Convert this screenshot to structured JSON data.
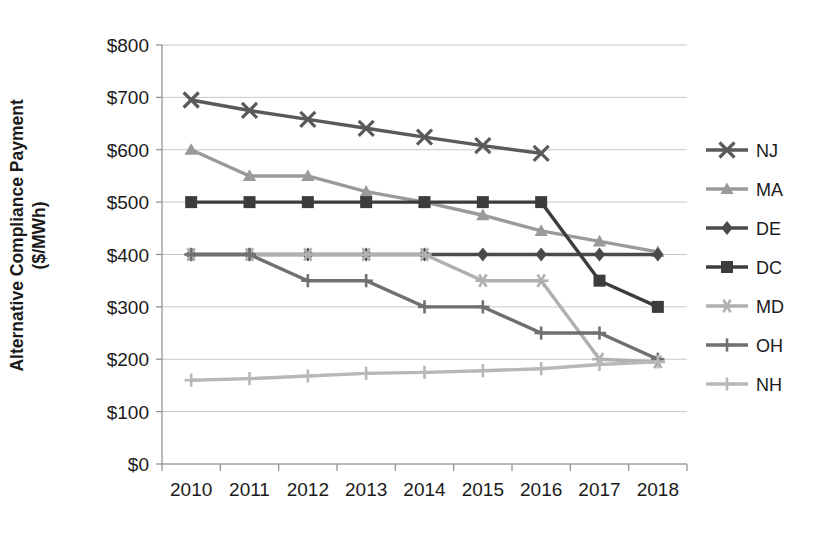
{
  "chart_data": {
    "type": "line",
    "title": "",
    "xlabel": "",
    "ylabel": "Alternative Compliance Payment ($/MWh)",
    "ylabel_line1": "Alternative Compliance Payment",
    "ylabel_line2": "($/MWh)",
    "categories": [
      "2010",
      "2011",
      "2012",
      "2013",
      "2014",
      "2015",
      "2016",
      "2017",
      "2018"
    ],
    "x": [
      2010,
      2011,
      2012,
      2013,
      2014,
      2015,
      2016,
      2017,
      2018
    ],
    "ylim": [
      0,
      800
    ],
    "ytick_values": [
      0,
      100,
      200,
      300,
      400,
      500,
      600,
      700,
      800
    ],
    "ytick_labels": [
      "$0",
      "$100",
      "$200",
      "$300",
      "$400",
      "$500",
      "$600",
      "$700",
      "$800"
    ],
    "grid": true,
    "legend_position": "right",
    "series": [
      {
        "name": "NJ",
        "marker": "x",
        "color": "#5a5a5a",
        "values": [
          695,
          675,
          658,
          641,
          624,
          608,
          593,
          null,
          null
        ]
      },
      {
        "name": "MA",
        "marker": "triangle",
        "color": "#9a9a9a",
        "values": [
          600,
          550,
          550,
          520,
          500,
          475,
          445,
          425,
          405
        ]
      },
      {
        "name": "DE",
        "marker": "diamond",
        "color": "#4a4a4a",
        "values": [
          400,
          400,
          400,
          400,
          400,
          400,
          400,
          400,
          400
        ]
      },
      {
        "name": "DC",
        "marker": "square",
        "color": "#3c3c3c",
        "values": [
          500,
          500,
          500,
          500,
          500,
          500,
          500,
          350,
          300
        ]
      },
      {
        "name": "MD",
        "marker": "asterisk",
        "color": "#b0b0b0",
        "values": [
          400,
          400,
          400,
          400,
          400,
          350,
          350,
          200,
          195
        ]
      },
      {
        "name": "OH",
        "marker": "plus",
        "color": "#707070",
        "values": [
          400,
          400,
          350,
          350,
          300,
          300,
          250,
          250,
          200
        ]
      },
      {
        "name": "NH",
        "marker": "plus",
        "color": "#b8b8b8",
        "values": [
          160,
          163,
          168,
          173,
          175,
          178,
          182,
          190,
          195
        ]
      }
    ]
  },
  "axes": {
    "y_title": "Alternative Compliance Payment ($/MWh)"
  }
}
